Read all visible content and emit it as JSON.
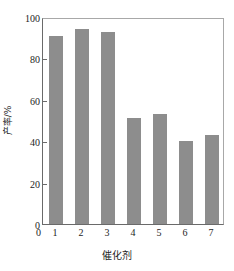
{
  "chart_data": {
    "type": "bar",
    "title": "",
    "subtitle": "",
    "xlabel": "催化剂",
    "ylabel": "产率/%",
    "categories": [
      "1",
      "2",
      "3",
      "4",
      "5",
      "6",
      "7"
    ],
    "values": [
      91,
      94,
      93,
      51,
      53,
      40,
      43
    ],
    "series": [
      {
        "name": "产率",
        "values": [
          91,
          94,
          93,
          51,
          53,
          40,
          43
        ]
      }
    ],
    "ylim": [
      0,
      100
    ],
    "xlim_labels": [
      "0",
      "1",
      "2",
      "3",
      "4",
      "5",
      "6",
      "7"
    ],
    "y_ticks": [
      0,
      20,
      40,
      60,
      80,
      100
    ],
    "y_tick_labels": [
      "0",
      "20",
      "40",
      "60",
      "80",
      "100"
    ],
    "x_tick_labels": [
      "1",
      "2",
      "3",
      "4",
      "5",
      "6",
      "7"
    ],
    "x_origin_label": "0",
    "grid": false,
    "legend": false,
    "legend_position": "none",
    "bar_color": "#8d8d8d",
    "axis_color": "#6a6a6a",
    "frame_color": "#a8a8a8",
    "text_color": "#1d1d1d",
    "background_color": "#ffffff",
    "annotations": []
  }
}
